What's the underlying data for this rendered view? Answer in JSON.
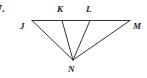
{
  "figure": {
    "problem_number": "7.",
    "type": "geometry-diagram",
    "stroke_color": "#333333",
    "background_color": "#ffffff",
    "label_color": "#1a1a1a",
    "stroke_width": 1,
    "points": [
      {
        "name": "J",
        "label": "J",
        "x": 32,
        "y": 20.5,
        "label_x": 20,
        "label_y": 22
      },
      {
        "name": "K",
        "label": "K",
        "x": 62,
        "y": 20.5,
        "label_x": 57,
        "label_y": 5
      },
      {
        "name": "L",
        "label": "L",
        "x": 90,
        "y": 20.5,
        "label_x": 86,
        "label_y": 5
      },
      {
        "name": "M",
        "label": "M",
        "x": 130,
        "y": 20.5,
        "label_x": 133,
        "label_y": 22
      },
      {
        "name": "N",
        "label": "N",
        "x": 73,
        "y": 60,
        "label_x": 68,
        "label_y": 65
      }
    ],
    "segments": [
      {
        "name": "segment-JM",
        "from": "J",
        "to": "M"
      },
      {
        "name": "segment-JN",
        "from": "J",
        "to": "N"
      },
      {
        "name": "segment-KN",
        "from": "K",
        "to": "N"
      },
      {
        "name": "segment-LN",
        "from": "L",
        "to": "N"
      },
      {
        "name": "segment-MN",
        "from": "M",
        "to": "N"
      }
    ]
  }
}
